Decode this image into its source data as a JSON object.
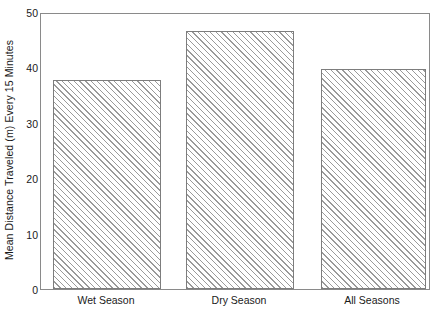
{
  "chart_data": {
    "type": "bar",
    "title": "",
    "xlabel": "",
    "ylabel": "Mean Distance Traveled (m) Every 15 Minutes",
    "categories": [
      "Wet Season",
      "Dry Season",
      "All Seasons"
    ],
    "values": [
      38,
      47,
      40
    ],
    "ylim": [
      0,
      50
    ],
    "yticks": [
      0,
      10,
      20,
      30,
      40,
      50
    ],
    "ytick_labels": [
      "0",
      "10",
      "20",
      "30",
      "40",
      "50"
    ],
    "grid": false,
    "legend": null,
    "series": [
      {
        "name": "Mean Distance Traveled",
        "values": [
          38,
          47,
          40
        ]
      }
    ],
    "bar_style": {
      "fill": "diagonal-hatch",
      "hatch_color": "#9a9a9a",
      "edge_color": "#7d7d7d",
      "background": "#ffffff"
    }
  },
  "axes": {
    "frame_color": "#8a8a8a",
    "tick_color": "#6e6e6e",
    "text_color": "#1a1a1a"
  }
}
